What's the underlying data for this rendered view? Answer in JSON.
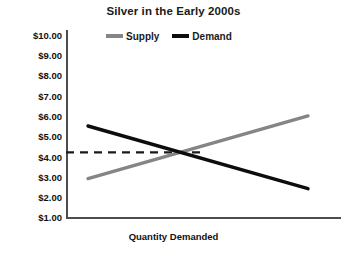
{
  "chart_data": {
    "type": "line",
    "title": "Silver in the Early 2000s",
    "xlabel": "Quantity Demanded",
    "ylabel": "",
    "ylim": [
      1.0,
      10.0
    ],
    "ytick_labels": [
      "$10.00",
      "$9.00",
      "$8.00",
      "$7.00",
      "$6.00",
      "$5.00",
      "$4.00",
      "$3.00",
      "$2.00",
      "$1.00"
    ],
    "ytick_values": [
      10.0,
      9.0,
      8.0,
      7.0,
      6.0,
      5.0,
      4.0,
      3.0,
      2.0,
      1.0
    ],
    "xtick_labels": [],
    "grid": false,
    "legend_position": "top-center",
    "series": [
      {
        "name": "Supply",
        "color": "#858585",
        "x": [
          0.08,
          0.88
        ],
        "values": [
          2.9,
          6.0
        ]
      },
      {
        "name": "Demand",
        "color": "#0d0d0d",
        "x": [
          0.08,
          0.88
        ],
        "values": [
          5.5,
          2.4
        ]
      }
    ],
    "annotations": [
      {
        "name": "equilibrium-price-line",
        "style": "dashed",
        "color": "#1a1a1a",
        "y_value": 4.2,
        "x_from": 0.0,
        "x_to": 0.5
      }
    ],
    "equilibrium": {
      "price": 4.2,
      "x": 0.5
    }
  },
  "legend": {
    "entries": [
      {
        "label": "Supply",
        "swatch": "supply"
      },
      {
        "label": "Demand",
        "swatch": "demand"
      }
    ]
  }
}
